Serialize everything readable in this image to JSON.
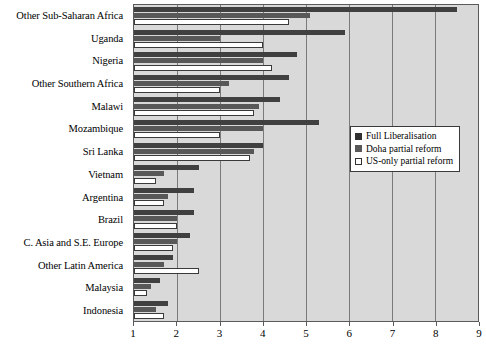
{
  "chart_data": {
    "type": "bar",
    "orientation": "horizontal",
    "title": "",
    "subtitle": "",
    "xlabel": "",
    "ylabel": "",
    "xlim": [
      1,
      9
    ],
    "xticks": [
      1,
      2,
      3,
      4,
      5,
      6,
      7,
      8,
      9
    ],
    "xtick_labels": [
      "1",
      "2",
      "3",
      "4",
      "5",
      "6",
      "7",
      "8",
      "9"
    ],
    "grid": true,
    "grid_axis": "x",
    "legend_position": "middle-right",
    "categories": [
      "Other Sub-Saharan Africa",
      "Uganda",
      "Nigeria",
      "Other Southern Africa",
      "Malawi",
      "Mozambique",
      "Sri Lanka",
      "Vietnam",
      "Argentina",
      "Brazil",
      "C. Asia and S.E. Europe",
      "Other Latin America",
      "Malaysia",
      "Indonesia"
    ],
    "series": [
      {
        "name": "Full Liberalisation",
        "color": "#404040",
        "values": [
          8.5,
          5.9,
          4.8,
          4.6,
          4.4,
          5.3,
          4.0,
          2.5,
          2.4,
          2.4,
          2.3,
          1.9,
          1.6,
          1.8
        ]
      },
      {
        "name": "Doha partial reform",
        "color": "#585858",
        "values": [
          5.1,
          3.0,
          4.0,
          3.2,
          3.9,
          4.0,
          3.8,
          1.7,
          1.8,
          2.0,
          2.0,
          1.7,
          1.4,
          1.5
        ]
      },
      {
        "name": "US-only partial reform",
        "color": "#ffffff",
        "values": [
          4.6,
          4.0,
          4.2,
          3.0,
          3.8,
          3.0,
          3.7,
          1.5,
          1.7,
          2.0,
          1.9,
          2.5,
          1.3,
          1.7
        ]
      }
    ]
  },
  "legend": {
    "items": [
      {
        "label": "Full Liberalisation"
      },
      {
        "label": "Doha partial reform"
      },
      {
        "label": "US-only partial reform"
      }
    ]
  },
  "colors": {
    "plot_background": "#d9d9d9",
    "gridline": "#7a7a7a",
    "axis": "#5a5a5a",
    "series_full_liberalisation": "#404040",
    "series_doha": "#585858",
    "series_us_only": "#ffffff"
  }
}
